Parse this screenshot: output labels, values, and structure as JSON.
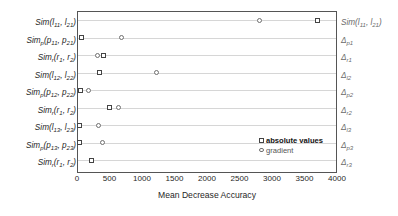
{
  "chart_data": {
    "type": "scatter",
    "title": "",
    "xlabel": "Mean Decrease Accuracy",
    "ylabel": "",
    "xlim": [
      0,
      4000
    ],
    "grid": true,
    "legend_position": "inside-bottom-right",
    "xticks": [
      0,
      500,
      1000,
      1500,
      2000,
      2500,
      3000,
      3500,
      4000
    ],
    "xtick_labels": [
      "0",
      "500",
      "1000",
      "1500",
      "2000",
      "2500",
      "3000",
      "3500",
      "4000"
    ],
    "categories": [
      "Sim(l11, l21)",
      "Simp(p11, p21)",
      "Simr(r1, r2)",
      "Sim(l12, l22)",
      "Simp(p12, p22)",
      "Simr(r1, r2)",
      "Sim(l13, l23)",
      "Simp(p13, p23)",
      "Simr(r1, r2)"
    ],
    "right_categories": [
      "Sim(l11, l21)",
      "Δp1",
      "Δr1",
      "Δl2",
      "Δp2",
      "Δr2",
      "Δl3",
      "Δp3",
      "Δr3"
    ],
    "series": [
      {
        "name": "absolute values",
        "marker": "square",
        "color": "#444444",
        "values": [
          3680,
          60,
          390,
          330,
          40,
          490,
          30,
          30,
          210
        ]
      },
      {
        "name": "gradient",
        "marker": "circle",
        "color": "#6f6f6f",
        "values": [
          2790,
          670,
          300,
          1215,
          160,
          620,
          310,
          380,
          null
        ]
      }
    ]
  },
  "ylabels": [
    {
      "base": "Sim",
      "basesub": "",
      "args": "(l",
      "s1": "11",
      "mid": ", l",
      "s2": "21",
      "end": ")"
    },
    {
      "base": "Sim",
      "basesub": "p",
      "args": "(p",
      "s1": "11",
      "mid": ", p",
      "s2": "21",
      "end": ")"
    },
    {
      "base": "Sim",
      "basesub": "r",
      "args": "(r",
      "s1": "1",
      "mid": ", r",
      "s2": "2",
      "end": ")"
    },
    {
      "base": "Sim",
      "basesub": "",
      "args": "(l",
      "s1": "12",
      "mid": ", l",
      "s2": "22",
      "end": ")"
    },
    {
      "base": "Sim",
      "basesub": "p",
      "args": "(p",
      "s1": "12",
      "mid": ", p",
      "s2": "22",
      "end": ")"
    },
    {
      "base": "Sim",
      "basesub": "r",
      "args": "(r",
      "s1": "1",
      "mid": ", r",
      "s2": "2",
      "end": ")"
    },
    {
      "base": "Sim",
      "basesub": "",
      "args": "(l",
      "s1": "13",
      "mid": ", l",
      "s2": "23",
      "end": ")"
    },
    {
      "base": "Sim",
      "basesub": "p",
      "args": "(p",
      "s1": "13",
      "mid": ", p",
      "s2": "23",
      "end": ")"
    },
    {
      "base": "Sim",
      "basesub": "r",
      "args": "(r",
      "s1": "1",
      "mid": ", r",
      "s2": "2",
      "end": ")"
    }
  ],
  "rlabels": [
    {
      "base": "Sim",
      "basesub": "",
      "args": "(l",
      "s1": "11",
      "mid": ", l",
      "s2": "21",
      "end": ")"
    },
    {
      "base": "Δ",
      "basesub": "p1",
      "args": "",
      "s1": "",
      "mid": "",
      "s2": "",
      "end": ""
    },
    {
      "base": "Δ",
      "basesub": "r1",
      "args": "",
      "s1": "",
      "mid": "",
      "s2": "",
      "end": ""
    },
    {
      "base": "Δ",
      "basesub": "l2",
      "args": "",
      "s1": "",
      "mid": "",
      "s2": "",
      "end": ""
    },
    {
      "base": "Δ",
      "basesub": "p2",
      "args": "",
      "s1": "",
      "mid": "",
      "s2": "",
      "end": ""
    },
    {
      "base": "Δ",
      "basesub": "r2",
      "args": "",
      "s1": "",
      "mid": "",
      "s2": "",
      "end": ""
    },
    {
      "base": "Δ",
      "basesub": "l3",
      "args": "",
      "s1": "",
      "mid": "",
      "s2": "",
      "end": ""
    },
    {
      "base": "Δ",
      "basesub": "p3",
      "args": "",
      "s1": "",
      "mid": "",
      "s2": "",
      "end": ""
    },
    {
      "base": "Δ",
      "basesub": "r3",
      "args": "",
      "s1": "",
      "mid": "",
      "s2": "",
      "end": ""
    }
  ],
  "legend": {
    "items": [
      {
        "label": "absolute values",
        "marker": "square",
        "bold": true
      },
      {
        "label": "gradient",
        "marker": "circle",
        "bold": false
      }
    ]
  },
  "colors": {
    "frame": "#555555",
    "grid": "#d6d6d6",
    "square_marker": "#444444",
    "circle_marker": "#6f6f6f",
    "text": "#1f1f1f",
    "right_text": "#6a6a6a"
  }
}
